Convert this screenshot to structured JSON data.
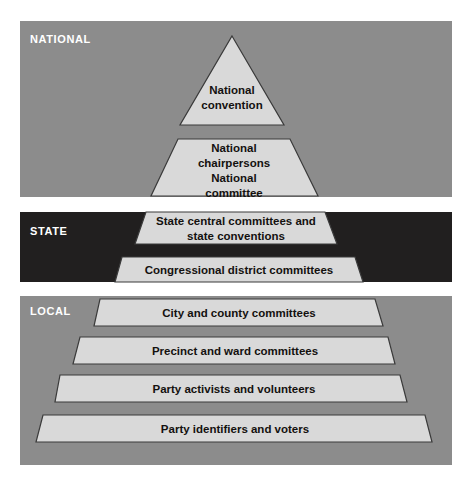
{
  "figure": {
    "name": "party-organization-pyramid",
    "width": 472,
    "height": 487,
    "background": "#ffffff"
  },
  "colors": {
    "band_national": "#8c8c8c",
    "band_state": "#211f1f",
    "band_local": "#8c8c8c",
    "tier_fill": "#d9d9d9",
    "tier_stroke": "#3a3a3a",
    "band_label_text": "#ffffff",
    "tier_label_text": "#14110f"
  },
  "bands": [
    {
      "id": "national",
      "label": "NATIONAL",
      "color": "#8c8c8c",
      "x": 20,
      "y": 21,
      "width": 432,
      "height": 176
    },
    {
      "id": "state",
      "label": "STATE",
      "color": "#211f1f",
      "x": 20,
      "y": 212,
      "width": 432,
      "height": 70
    },
    {
      "id": "local",
      "label": "LOCAL",
      "color": "#8c8c8c",
      "x": 20,
      "y": 296,
      "width": 432,
      "height": 169
    }
  ],
  "band_label_positions": [
    {
      "x": 30,
      "y": 43
    },
    {
      "x": 30,
      "y": 235
    },
    {
      "x": 30,
      "y": 315
    }
  ],
  "tiers": [
    {
      "id": "national-convention",
      "band": "national",
      "shape": "triangle",
      "lines": [
        "National",
        "convention"
      ],
      "points": "232,36 284,125 180,125",
      "text_x": 232,
      "text_y": 94
    },
    {
      "id": "national-chairpersons-committee",
      "band": "national",
      "shape": "trapezoid",
      "lines": [
        "National",
        "chairpersons",
        "National",
        "committee"
      ],
      "points": "178,139 290,139 318,196 151,196",
      "text_x": 234,
      "text_y": 152
    },
    {
      "id": "state-central-committees",
      "band": "state",
      "shape": "trapezoid",
      "lines": [
        "State central committees and",
        "state conventions"
      ],
      "points": "146,212 325,212 337,244 135,244",
      "text_x": 236,
      "text_y": 225
    },
    {
      "id": "congressional-district-committees",
      "band": "state",
      "shape": "trapezoid",
      "lines": [
        "Congressional district committees"
      ],
      "points": "122,257 355,257 363,282 115,282",
      "text_x": 239,
      "text_y": 274
    },
    {
      "id": "city-and-county-committees",
      "band": "local",
      "shape": "trapezoid",
      "lines": [
        "City and county committees"
      ],
      "points": "100,299 375,299 383,326 94,326",
      "text_x": 239,
      "text_y": 317
    },
    {
      "id": "precinct-and-ward-committees",
      "band": "local",
      "shape": "trapezoid",
      "lines": [
        "Precinct and ward committees"
      ],
      "points": "80,337 388,337 395,364 73,364",
      "text_x": 235,
      "text_y": 355
    },
    {
      "id": "party-activists-and-volunteers",
      "band": "local",
      "shape": "trapezoid",
      "lines": [
        "Party activists and volunteers"
      ],
      "points": "60,375 400,375 407,402 55,402",
      "text_x": 234,
      "text_y": 393
    },
    {
      "id": "party-identifiers-and-voters",
      "band": "local",
      "shape": "trapezoid",
      "lines": [
        "Party identifiers and voters"
      ],
      "points": "43,415 425,415 432,442 36,442",
      "text_x": 235,
      "text_y": 433
    }
  ]
}
